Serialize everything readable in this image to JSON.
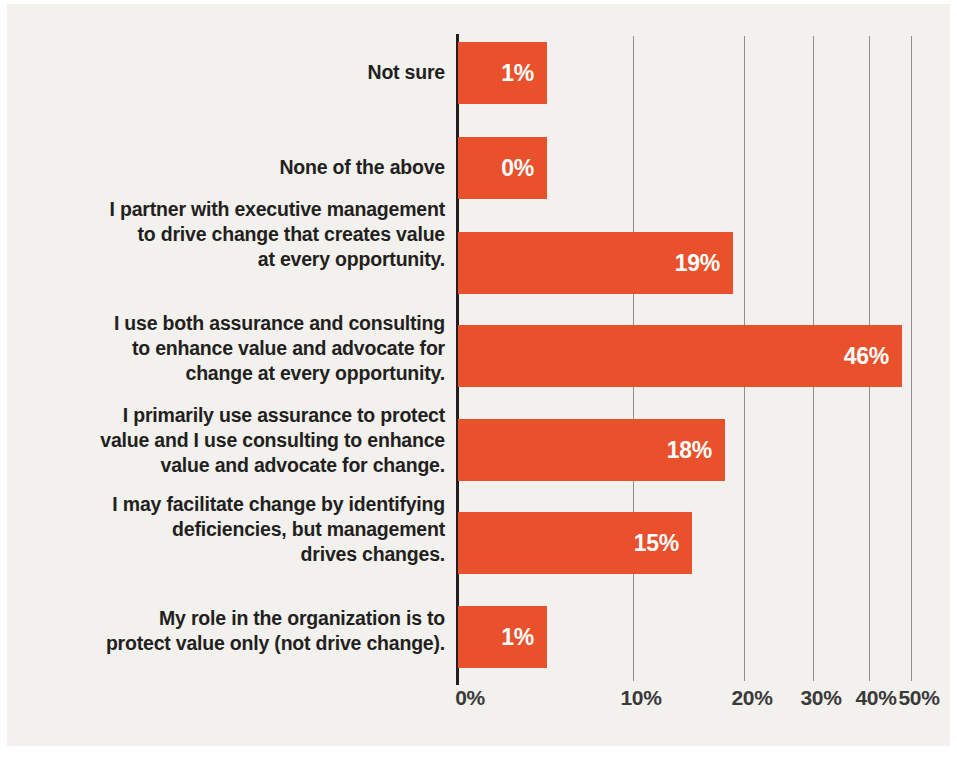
{
  "chart_data": {
    "type": "bar",
    "orientation": "horizontal",
    "title": "",
    "subtitle": "",
    "xlabel": "",
    "ylabel": "",
    "xlim": [
      0,
      50
    ],
    "grid": true,
    "legend": null,
    "bar_color": "#e8512b",
    "value_label_color": "#ffffff",
    "background_color": "#f2f1ee",
    "axis_color": "#231f20",
    "gridline_color": "#8e8e8e",
    "categories": [
      "Not sure",
      "None of the above",
      "I partner with executive management to drive change that creates value at every opportunity.",
      "I use both assurance and consulting to enhance value and advocate for change at every opportunity.",
      "I primarily use assurance to protect value and I use consulting to enhance value and advocate for change.",
      "I may facilitate change by identifying deficiencies, but management drives changes.",
      "My role in the organization is to protect value only (not drive change)."
    ],
    "values": [
      1,
      0,
      19,
      46,
      18,
      15,
      1
    ],
    "value_labels": [
      "1%",
      "0%",
      "19%",
      "46%",
      "18%",
      "15%",
      "1%"
    ],
    "xtick_values": [
      0,
      10,
      20,
      30,
      40,
      50
    ],
    "xtick_labels": [
      "0%",
      "10%",
      "20%",
      "30%",
      "40%",
      "50%"
    ]
  },
  "bars": [
    {
      "label_lines": [
        "Not sure"
      ],
      "value_label": "1%",
      "value": 1,
      "label_top": 60,
      "bar_top": 42,
      "bar_height": 62,
      "bar_width": 89
    },
    {
      "label_lines": [
        "None of the above"
      ],
      "value_label": "0%",
      "value": 0,
      "label_top": 155,
      "bar_top": 137,
      "bar_height": 62,
      "bar_width": 89
    },
    {
      "label_lines": [
        "I partner with executive management",
        "to drive change that creates value",
        "at every opportunity."
      ],
      "value_label": "19%",
      "value": 19,
      "label_top": 197,
      "bar_top": 232,
      "bar_height": 62,
      "bar_width": 275
    },
    {
      "label_lines": [
        "I use both assurance and consulting",
        "to enhance value and advocate for",
        "change at every opportunity."
      ],
      "value_label": "46%",
      "value": 46,
      "label_top": 311,
      "bar_top": 325,
      "bar_height": 62,
      "bar_width": 444
    },
    {
      "label_lines": [
        "I primarily use assurance to protect",
        "value and I use consulting to enhance",
        "value and advocate for change."
      ],
      "value_label": "18%",
      "value": 18,
      "label_top": 403,
      "bar_top": 419,
      "bar_height": 62,
      "bar_width": 267
    },
    {
      "label_lines": [
        "I may facilitate change by identifying",
        "deficiencies, but management",
        "drives changes."
      ],
      "value_label": "15%",
      "value": 15,
      "label_top": 492,
      "bar_top": 512,
      "bar_height": 62,
      "bar_width": 234
    },
    {
      "label_lines": [
        "My role in the organization is to",
        "protect value only (not drive change)."
      ],
      "value_label": "1%",
      "value": 1,
      "label_top": 606,
      "bar_top": 606,
      "bar_height": 62,
      "bar_width": 89
    }
  ],
  "gridlines": [
    {
      "label": "10%",
      "x": 633
    },
    {
      "label": "20%",
      "x": 744
    },
    {
      "label": "30%",
      "x": 813
    },
    {
      "label": "40%",
      "x": 869
    },
    {
      "label": "50%",
      "x": 911
    }
  ],
  "xticks": [
    {
      "label": "0%",
      "x": 470
    },
    {
      "label": "10%",
      "x": 641
    },
    {
      "label": "20%",
      "x": 752
    },
    {
      "label": "30%",
      "x": 821
    },
    {
      "label": "40%",
      "x": 876
    },
    {
      "label": "50%",
      "x": 919
    }
  ]
}
